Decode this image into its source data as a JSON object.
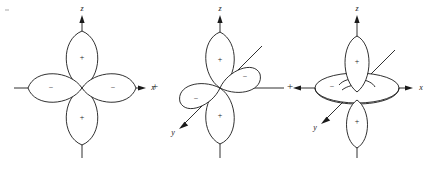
{
  "figure": {
    "background_color": "#ffffff",
    "line_color": "#1a1a1a",
    "width": 429,
    "height": 172
  },
  "connectors": [
    {
      "symbol": "+",
      "name": "plus-operator-1"
    },
    {
      "symbol": "+",
      "name": "plus-operator-2"
    }
  ],
  "diagrams": [
    {
      "id": "diagram-1",
      "orbital": "d-x2-y2",
      "axes": [
        {
          "label": "z",
          "direction": "up",
          "arrow": true
        },
        {
          "label": "x",
          "direction": "right",
          "arrow": true
        },
        {
          "label": "",
          "direction": "down",
          "arrow": false
        },
        {
          "label": "",
          "direction": "left",
          "arrow": false
        }
      ],
      "lobes": [
        {
          "position": "top",
          "sign": "+"
        },
        {
          "position": "right",
          "sign": "−"
        },
        {
          "position": "bottom",
          "sign": "+"
        },
        {
          "position": "left",
          "sign": "−"
        }
      ]
    },
    {
      "id": "diagram-2",
      "orbital": "d-yz",
      "axes": [
        {
          "label": "z",
          "direction": "up",
          "arrow": true
        },
        {
          "label": "x",
          "direction": "right",
          "arrow": false
        },
        {
          "label": "y",
          "direction": "down-left",
          "arrow": true
        },
        {
          "label": "",
          "direction": "down",
          "arrow": false
        },
        {
          "label": "",
          "direction": "up-right",
          "arrow": false
        }
      ],
      "lobes": [
        {
          "position": "top",
          "sign": "+"
        },
        {
          "position": "upper-right",
          "sign": "−"
        },
        {
          "position": "lower-left",
          "sign": "−"
        },
        {
          "position": "bottom",
          "sign": "+"
        }
      ]
    },
    {
      "id": "diagram-3",
      "orbital": "d-z2",
      "axes": [
        {
          "label": "z",
          "direction": "up",
          "arrow": true
        },
        {
          "label": "x",
          "direction": "right",
          "arrow": true
        },
        {
          "label": "y",
          "direction": "down-left",
          "arrow": true
        },
        {
          "label": "",
          "direction": "left",
          "arrow": true
        },
        {
          "label": "",
          "direction": "down",
          "arrow": false
        },
        {
          "label": "",
          "direction": "up-right",
          "arrow": false
        }
      ],
      "lobes": [
        {
          "position": "top",
          "sign": "+"
        },
        {
          "position": "bottom",
          "sign": "+"
        },
        {
          "position": "torus",
          "sign": "−"
        }
      ]
    }
  ]
}
